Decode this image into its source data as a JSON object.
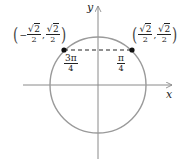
{
  "figure": {
    "axes": {
      "x_label": "x",
      "y_label": "y"
    },
    "circle": {
      "type": "unit-circle"
    },
    "points": [
      {
        "name": "point-3pi-4",
        "angle_num": "3π",
        "angle_den": "4",
        "coord_x_sign": "−",
        "coord_x_num": "2",
        "coord_x_den": "2",
        "coord_y_num": "2",
        "coord_y_den": "2",
        "coords_text": "(−√2/2, √2/2)"
      },
      {
        "name": "point-pi-4",
        "angle_num": "π",
        "angle_den": "4",
        "coord_x_num": "2",
        "coord_x_den": "2",
        "coord_y_num": "2",
        "coord_y_den": "2",
        "coords_text": "(√2/2, √2/2)"
      }
    ],
    "symbols": {
      "sqrt": "√",
      "lparen": "(",
      "rparen": ")",
      "comma": ","
    },
    "colors": {
      "circle": "#9a9a9a",
      "axes": "#8a8a8a",
      "dash": "#222222",
      "dot": "#111111"
    }
  }
}
